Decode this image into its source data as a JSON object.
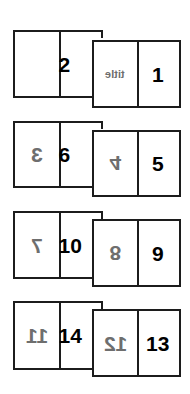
{
  "diagram": {
    "type": "booklet-imposition",
    "sheets": [
      {
        "back": {
          "left": {
            "label": "",
            "style": "none"
          },
          "right": {
            "label": "2",
            "style": "normal"
          }
        },
        "front": {
          "left": {
            "label": "title",
            "style": "mirrored-gray"
          },
          "right": {
            "label": "1",
            "style": "normal"
          }
        }
      },
      {
        "back": {
          "left": {
            "label": "3",
            "style": "mirrored-gray"
          },
          "right": {
            "label": "6",
            "style": "normal"
          }
        },
        "front": {
          "left": {
            "label": "4",
            "style": "flipped-vertical-gray"
          },
          "right": {
            "label": "5",
            "style": "normal"
          }
        }
      },
      {
        "back": {
          "left": {
            "label": "7",
            "style": "mirrored-gray"
          },
          "right": {
            "label": "10",
            "style": "normal-partially-hidden"
          }
        },
        "front": {
          "left": {
            "label": "8",
            "style": "flipped-vertical-gray"
          },
          "right": {
            "label": "9",
            "style": "normal"
          }
        }
      },
      {
        "back": {
          "left": {
            "label": "11",
            "style": "mirrored-gray"
          },
          "right": {
            "label": "14",
            "style": "normal-partially-hidden"
          }
        },
        "front": {
          "left": {
            "label": "12",
            "style": "mirrored-gray"
          },
          "right": {
            "label": "13",
            "style": "normal"
          }
        }
      }
    ],
    "colors": {
      "border": "#1c1c1c",
      "ink": "#000000",
      "ghost_ink": "#6e6e6e",
      "background": "#ffffff"
    }
  }
}
